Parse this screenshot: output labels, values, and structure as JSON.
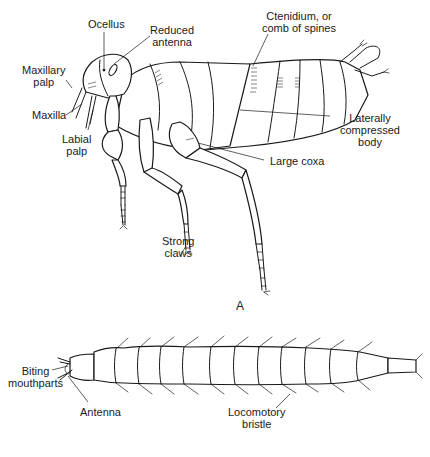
{
  "figure": {
    "panel_label": "A",
    "flea": {
      "labels": {
        "ocellus": "Ocellus",
        "reduced_antenna": "Reduced\nantenna",
        "ctenidium": "Ctenidium, or\ncomb of spines",
        "maxillary_palp": "Maxillary\npalp",
        "maxilla": "Maxilla",
        "labial_palp": "Labial\npalp",
        "laterally_compressed_body": "Laterally\ncompressed\nbody",
        "large_coxa": "Large coxa",
        "strong_claws": "Strong\nclaws"
      }
    },
    "larva": {
      "labels": {
        "biting_mouthparts": "Biting\nmouthparts",
        "antenna": "Antenna",
        "locomotory_bristle": "Locomotory\nbristle"
      }
    }
  }
}
